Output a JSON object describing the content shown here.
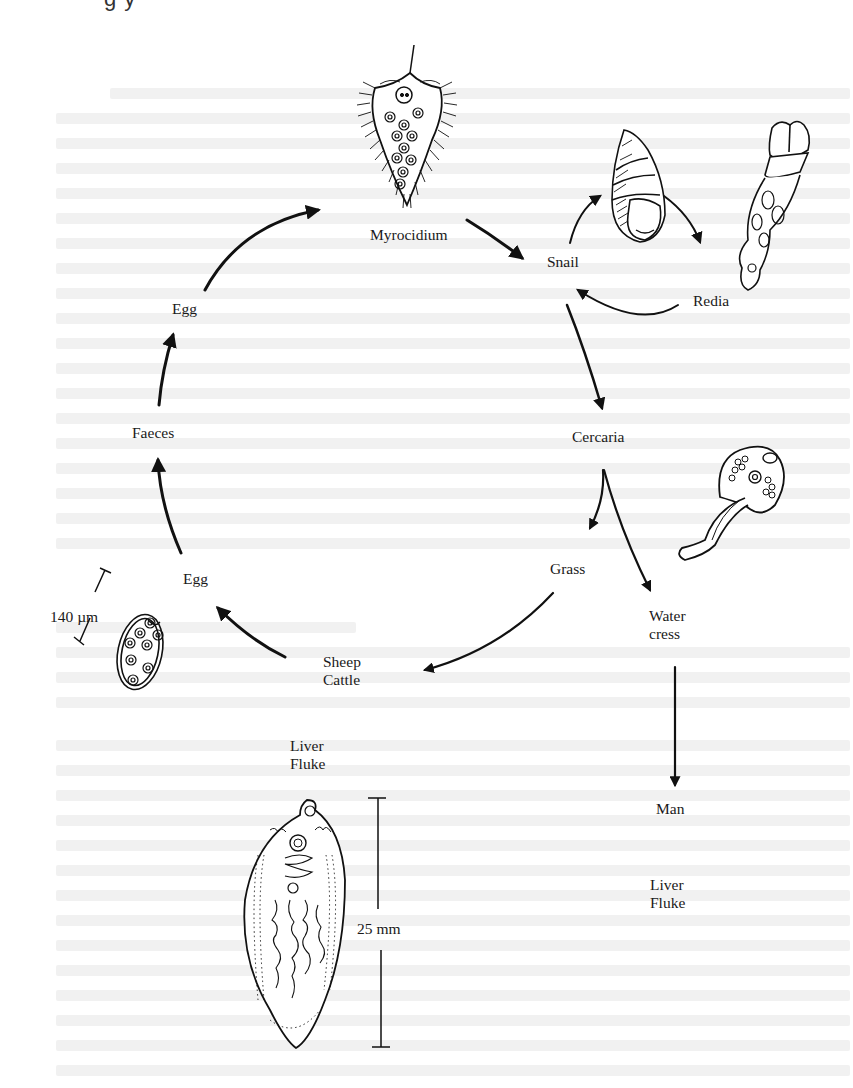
{
  "header": {
    "clipped_title_fragment": "g y"
  },
  "diagram": {
    "type": "life-cycle",
    "subject": "Liver fluke",
    "nodes": {
      "myrocidium": "Myrocidium",
      "snail": "Snail",
      "redia": "Redia",
      "cercaria": "Cercaria",
      "grass": "Grass",
      "water_cress_line1": "Water",
      "water_cress_line2": "cress",
      "man": "Man",
      "man_fluke_line1": "Liver",
      "man_fluke_line2": "Fluke",
      "sheep_cattle_line1": "Sheep",
      "sheep_cattle_line2": "Cattle",
      "egg_lower": "Egg",
      "faeces": "Faeces",
      "egg_upper": "Egg",
      "liver_fluke_line1": "Liver",
      "liver_fluke_line2": "Fluke"
    },
    "scales": {
      "egg_scale": "140 µm",
      "fluke_scale": "25 mm"
    },
    "edges": [
      {
        "from": "Egg",
        "to": "Myrocidium"
      },
      {
        "from": "Myrocidium",
        "to": "Snail"
      },
      {
        "from": "Snail",
        "to": "Redia"
      },
      {
        "from": "Redia",
        "to": "Snail"
      },
      {
        "from": "Snail",
        "to": "Cercaria"
      },
      {
        "from": "Cercaria",
        "to": "Grass"
      },
      {
        "from": "Cercaria",
        "to": "Water cress"
      },
      {
        "from": "Grass",
        "to": "Sheep Cattle"
      },
      {
        "from": "Water cress",
        "to": "Man"
      },
      {
        "from": "Sheep Cattle",
        "to": "Egg"
      },
      {
        "from": "Egg",
        "to": "Faeces"
      },
      {
        "from": "Faeces",
        "to": "Egg"
      }
    ],
    "illustrations": [
      "myrocidium",
      "snail-shell",
      "redia",
      "cercaria",
      "egg",
      "liver-fluke"
    ]
  }
}
